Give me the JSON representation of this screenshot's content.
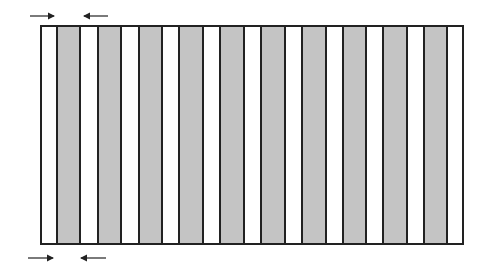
{
  "diagram": {
    "colors": {
      "gray": "#c4c4c4",
      "white": "#ffffff",
      "border": "#222222"
    },
    "frame": {
      "left": 40,
      "top": 25,
      "width": 424,
      "height": 220
    },
    "gray_stripes": [
      {
        "x": 56,
        "w": 25
      },
      {
        "x": 97,
        "w": 25
      },
      {
        "x": 138,
        "w": 25
      },
      {
        "x": 178,
        "w": 26
      },
      {
        "x": 219,
        "w": 26
      },
      {
        "x": 260,
        "w": 26
      },
      {
        "x": 301,
        "w": 26
      },
      {
        "x": 342,
        "w": 25
      },
      {
        "x": 382,
        "w": 26
      },
      {
        "x": 423,
        "w": 25
      }
    ],
    "arrows": [
      {
        "position": "top-left",
        "direction": "right",
        "x1": 30,
        "x2": 54,
        "y": 16
      },
      {
        "position": "top-second",
        "direction": "left",
        "x1": 84,
        "x2": 108,
        "y": 16
      },
      {
        "position": "bottom-left",
        "direction": "right",
        "x1": 28,
        "x2": 53,
        "y": 258
      },
      {
        "position": "bottom-second",
        "direction": "left",
        "x1": 81,
        "x2": 106,
        "y": 258
      }
    ]
  }
}
